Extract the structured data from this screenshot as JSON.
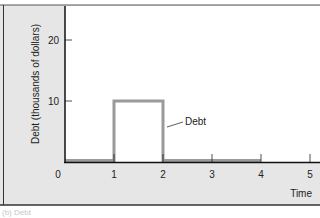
{
  "chart_data": {
    "type": "line",
    "title": "",
    "xlabel": "Time",
    "ylabel": "Debt (thousands of dollars)",
    "x_ticks": [
      "0",
      "1",
      "2",
      "3",
      "4",
      "5"
    ],
    "y_ticks": [
      "10",
      "20"
    ],
    "xlim": [
      0,
      5
    ],
    "ylim": [
      0,
      25
    ],
    "grid": false,
    "series": [
      {
        "name": "Debt",
        "x": [
          0,
          1,
          1,
          2,
          2,
          4
        ],
        "values": [
          0,
          0,
          10,
          10,
          0,
          0
        ],
        "color": "#9a9a9a"
      }
    ],
    "annotations": [
      {
        "text": "Debt",
        "x": 2.5,
        "y": 6.5
      }
    ],
    "caption": "(b) Debt"
  },
  "colors": {
    "panel_bg": "#e6e6e6",
    "plot_bg": "#ffffff",
    "axis": "#111111",
    "series": "#9a9a9a"
  }
}
